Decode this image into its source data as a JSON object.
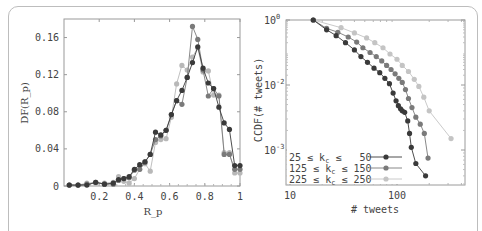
{
  "chart_data": [
    {
      "type": "line",
      "title": "",
      "xlabel": "R_p",
      "ylabel": "DF(R_p)",
      "xlim": [
        0.03,
        1.0
      ],
      "ylim": [
        0,
        0.18
      ],
      "xticks": [
        0.2,
        0.4,
        0.6,
        0.8,
        1
      ],
      "xtick_labels": [
        "0.2",
        "0.4",
        "0.6",
        "0.8",
        "1"
      ],
      "yticks": [
        0,
        0.04,
        0.08,
        0.12,
        0.16
      ],
      "ytick_labels": [
        "0",
        "0.04",
        "0.08",
        "0.12",
        "0.16"
      ],
      "grid": false,
      "series": [
        {
          "name": "25 ≤ k_c ≤ 50",
          "color": "#3a3a3a",
          "x": [
            0.03,
            0.08,
            0.13,
            0.18,
            0.23,
            0.28,
            0.31,
            0.34,
            0.37,
            0.4,
            0.43,
            0.46,
            0.49,
            0.52,
            0.55,
            0.58,
            0.61,
            0.64,
            0.67,
            0.7,
            0.73,
            0.76,
            0.79,
            0.82,
            0.85,
            0.88,
            0.91,
            0.94,
            0.97,
            1.0
          ],
          "y": [
            0.001,
            0.001,
            0.001,
            0.004,
            0.002,
            0.003,
            0.007,
            0.008,
            0.01,
            0.018,
            0.023,
            0.026,
            0.034,
            0.058,
            0.055,
            0.06,
            0.077,
            0.092,
            0.103,
            0.117,
            0.133,
            0.15,
            0.127,
            0.111,
            0.105,
            0.085,
            0.068,
            0.061,
            0.022,
            0.022
          ]
        },
        {
          "name": "125 ≤ k_c ≤ 150",
          "color": "#7a7a7a",
          "x": [
            0.03,
            0.08,
            0.13,
            0.18,
            0.23,
            0.28,
            0.31,
            0.34,
            0.37,
            0.4,
            0.43,
            0.46,
            0.49,
            0.52,
            0.55,
            0.58,
            0.61,
            0.64,
            0.67,
            0.7,
            0.73,
            0.76,
            0.79,
            0.82,
            0.85,
            0.88,
            0.91,
            0.94,
            0.97,
            1.0
          ],
          "y": [
            0.001,
            0.001,
            0.002,
            0.004,
            0.002,
            0.002,
            0.006,
            0.008,
            0.009,
            0.017,
            0.018,
            0.026,
            0.034,
            0.05,
            0.054,
            0.06,
            0.077,
            0.092,
            0.088,
            0.117,
            0.172,
            0.158,
            0.125,
            0.097,
            0.105,
            0.097,
            0.034,
            0.034,
            0.018,
            0.018
          ]
        },
        {
          "name": "225 ≤ k_c ≤ 250",
          "color": "#b8b8b8",
          "x": [
            0.03,
            0.08,
            0.13,
            0.18,
            0.23,
            0.28,
            0.31,
            0.34,
            0.37,
            0.4,
            0.43,
            0.46,
            0.49,
            0.52,
            0.55,
            0.58,
            0.61,
            0.64,
            0.67,
            0.7,
            0.73,
            0.76,
            0.79,
            0.82,
            0.85,
            0.88,
            0.91,
            0.94,
            0.97,
            1.0
          ],
          "y": [
            0.001,
            0.001,
            0.003,
            0.003,
            0.003,
            0.004,
            0.01,
            0.005,
            0.003,
            0.008,
            0.018,
            0.024,
            0.016,
            0.047,
            0.05,
            0.051,
            0.074,
            0.11,
            0.13,
            0.125,
            0.139,
            0.149,
            0.123,
            0.124,
            0.098,
            0.098,
            0.036,
            0.036,
            0.014,
            0.014
          ]
        }
      ]
    },
    {
      "type": "line",
      "title": "",
      "xlabel": "# tweets",
      "ylabel": "CCDF(# tweets)",
      "xscale": "log",
      "yscale": "log",
      "xlim": [
        10,
        400
      ],
      "xticks": [
        10,
        100
      ],
      "xtick_labels": [
        "10",
        "100"
      ],
      "yticks": [
        1,
        0.01,
        0.001
      ],
      "ytick_labels": [
        {
          "base": "10",
          "exp": "0"
        },
        {
          "base": "10",
          "exp": "-2"
        },
        {
          "base": "10",
          "exp": "-3"
        }
      ],
      "grid": false,
      "legend_position": "bottom-left",
      "series": [
        {
          "name": "25 ≤ k_c ≤ 50",
          "legend_parts": [
            "25",
            "k",
            "c",
            "50"
          ],
          "color": "#3a3a3a",
          "x": [
            16.5,
            22,
            27,
            33,
            40,
            46,
            53,
            61,
            69,
            77,
            85,
            92,
            98,
            103,
            108,
            112,
            118,
            126,
            131,
            136,
            150,
            185
          ],
          "y": [
            1.0,
            0.5,
            0.33,
            0.2,
            0.12,
            0.075,
            0.05,
            0.033,
            0.024,
            0.016,
            0.011,
            0.0075,
            0.0057,
            0.0048,
            0.0043,
            0.004,
            0.0038,
            0.0028,
            0.0018,
            0.0011,
            0.00062,
            0.0004
          ]
        },
        {
          "name": "125 ≤ k_c ≤ 150",
          "legend_parts": [
            "125",
            "k",
            "c",
            "150"
          ],
          "color": "#7a7a7a",
          "x": [
            16.5,
            22,
            28,
            35,
            42,
            48,
            56,
            64,
            72,
            80,
            88,
            96,
            104,
            112,
            120,
            128,
            138,
            150,
            165,
            180,
            195
          ],
          "y": [
            1.0,
            0.55,
            0.42,
            0.3,
            0.21,
            0.14,
            0.1,
            0.075,
            0.055,
            0.04,
            0.03,
            0.022,
            0.016,
            0.012,
            0.0085,
            0.0062,
            0.0045,
            0.0032,
            0.0025,
            0.0018,
            0.00075
          ]
        },
        {
          "name": "225 ≤ k_c ≤ 250",
          "legend_parts": [
            "225",
            "k",
            "c",
            "250"
          ],
          "color": "#c4c4c4",
          "x": [
            16.5,
            30,
            40,
            52,
            62,
            74,
            86,
            100,
            112,
            128,
            145,
            160,
            178,
            200,
            320
          ],
          "y": [
            1.0,
            0.58,
            0.4,
            0.28,
            0.2,
            0.14,
            0.09,
            0.062,
            0.04,
            0.026,
            0.015,
            0.0095,
            0.0065,
            0.004,
            0.0015
          ]
        }
      ]
    }
  ]
}
